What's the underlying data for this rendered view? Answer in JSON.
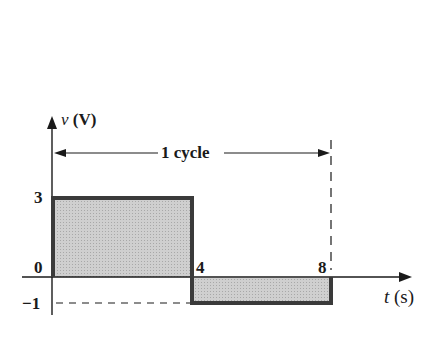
{
  "diagram": {
    "type": "square-wave",
    "y_axis_label_var": "v",
    "y_axis_label_unit": "(V)",
    "x_axis_label_var": "t",
    "x_axis_label_unit": "(s)",
    "cycle_label": "1 cycle",
    "y_ticks": [
      "3",
      "0",
      "−1"
    ],
    "x_ticks": [
      "4",
      "8"
    ],
    "segments": [
      {
        "t_start": 0,
        "t_end": 4,
        "v": 3
      },
      {
        "t_start": 4,
        "t_end": 8,
        "v": -1
      }
    ],
    "colors": {
      "axis": "#1a1a1a",
      "waveform": "#3a3a3a",
      "fill": "#c8c8c8"
    }
  }
}
